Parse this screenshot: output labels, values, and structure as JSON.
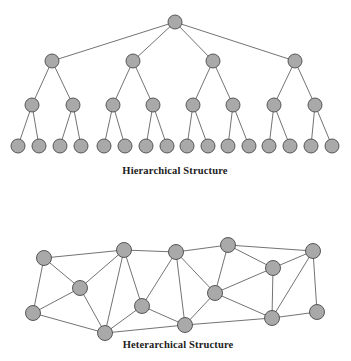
{
  "figure": {
    "width": 351,
    "height": 361,
    "background_color": "#ffffff",
    "node_fill_color": "#a9a9a9",
    "node_stroke_color": "#4a4a4a",
    "edge_color": "#5a5a5a",
    "caption_color": "#1c1c1c"
  },
  "diagrams": [
    {
      "id": "hierarchical",
      "caption": "Hierarchical Structure",
      "caption_position": {
        "x": 175,
        "y": 174
      },
      "node_radius": 7,
      "levels": [
        {
          "level": 1,
          "count": 1
        },
        {
          "level": 2,
          "count": 4
        },
        {
          "level": 3,
          "count": 8
        },
        {
          "level": 4,
          "count": 16
        }
      ],
      "nodes": [
        {
          "id": "h0",
          "x": 175,
          "y": 22,
          "level": 1
        },
        {
          "id": "h1",
          "x": 52,
          "y": 61,
          "level": 2
        },
        {
          "id": "h2",
          "x": 133,
          "y": 61,
          "level": 2
        },
        {
          "id": "h3",
          "x": 213,
          "y": 61,
          "level": 2
        },
        {
          "id": "h4",
          "x": 295,
          "y": 61,
          "level": 2
        },
        {
          "id": "h5",
          "x": 32,
          "y": 105,
          "level": 3
        },
        {
          "id": "h6",
          "x": 73,
          "y": 105,
          "level": 3
        },
        {
          "id": "h7",
          "x": 113,
          "y": 105,
          "level": 3
        },
        {
          "id": "h8",
          "x": 153,
          "y": 105,
          "level": 3
        },
        {
          "id": "h9",
          "x": 193,
          "y": 105,
          "level": 3
        },
        {
          "id": "h10",
          "x": 233,
          "y": 105,
          "level": 3
        },
        {
          "id": "h11",
          "x": 274,
          "y": 105,
          "level": 3
        },
        {
          "id": "h12",
          "x": 315,
          "y": 105,
          "level": 3
        },
        {
          "id": "h13",
          "x": 18,
          "y": 146,
          "level": 4
        },
        {
          "id": "h14",
          "x": 39,
          "y": 146,
          "level": 4
        },
        {
          "id": "h15",
          "x": 60,
          "y": 146,
          "level": 4
        },
        {
          "id": "h16",
          "x": 81,
          "y": 146,
          "level": 4
        },
        {
          "id": "h17",
          "x": 104,
          "y": 146,
          "level": 4
        },
        {
          "id": "h18",
          "x": 125,
          "y": 146,
          "level": 4
        },
        {
          "id": "h19",
          "x": 146,
          "y": 146,
          "level": 4
        },
        {
          "id": "h20",
          "x": 167,
          "y": 146,
          "level": 4
        },
        {
          "id": "h21",
          "x": 187,
          "y": 146,
          "level": 4
        },
        {
          "id": "h22",
          "x": 208,
          "y": 146,
          "level": 4
        },
        {
          "id": "h23",
          "x": 228,
          "y": 146,
          "level": 4
        },
        {
          "id": "h24",
          "x": 249,
          "y": 146,
          "level": 4
        },
        {
          "id": "h25",
          "x": 269,
          "y": 146,
          "level": 4
        },
        {
          "id": "h26",
          "x": 290,
          "y": 146,
          "level": 4
        },
        {
          "id": "h27",
          "x": 311,
          "y": 146,
          "level": 4
        },
        {
          "id": "h28",
          "x": 332,
          "y": 146,
          "level": 4
        }
      ],
      "edges": [
        [
          "h0",
          "h1"
        ],
        [
          "h0",
          "h2"
        ],
        [
          "h0",
          "h3"
        ],
        [
          "h0",
          "h4"
        ],
        [
          "h1",
          "h5"
        ],
        [
          "h1",
          "h6"
        ],
        [
          "h2",
          "h7"
        ],
        [
          "h2",
          "h8"
        ],
        [
          "h3",
          "h9"
        ],
        [
          "h3",
          "h10"
        ],
        [
          "h4",
          "h11"
        ],
        [
          "h4",
          "h12"
        ],
        [
          "h5",
          "h13"
        ],
        [
          "h5",
          "h14"
        ],
        [
          "h6",
          "h15"
        ],
        [
          "h6",
          "h16"
        ],
        [
          "h7",
          "h17"
        ],
        [
          "h7",
          "h18"
        ],
        [
          "h8",
          "h19"
        ],
        [
          "h8",
          "h20"
        ],
        [
          "h9",
          "h21"
        ],
        [
          "h9",
          "h22"
        ],
        [
          "h10",
          "h23"
        ],
        [
          "h10",
          "h24"
        ],
        [
          "h11",
          "h25"
        ],
        [
          "h11",
          "h26"
        ],
        [
          "h12",
          "h27"
        ],
        [
          "h12",
          "h28"
        ]
      ]
    },
    {
      "id": "heterarchical",
      "caption": "Heterarchical Structure",
      "caption_position": {
        "x": 178,
        "y": 348
      },
      "node_radius": 7.5,
      "nodes": [
        {
          "id": "n0",
          "x": 44,
          "y": 258
        },
        {
          "id": "n1",
          "x": 80,
          "y": 288
        },
        {
          "id": "n2",
          "x": 33,
          "y": 313
        },
        {
          "id": "n3",
          "x": 105,
          "y": 333
        },
        {
          "id": "n4",
          "x": 124,
          "y": 250
        },
        {
          "id": "n5",
          "x": 142,
          "y": 306
        },
        {
          "id": "n6",
          "x": 176,
          "y": 252
        },
        {
          "id": "n7",
          "x": 185,
          "y": 325
        },
        {
          "id": "n8",
          "x": 215,
          "y": 293
        },
        {
          "id": "n9",
          "x": 228,
          "y": 245
        },
        {
          "id": "n10",
          "x": 273,
          "y": 268
        },
        {
          "id": "n11",
          "x": 313,
          "y": 251
        },
        {
          "id": "n12",
          "x": 272,
          "y": 318
        },
        {
          "id": "n13",
          "x": 317,
          "y": 312
        }
      ],
      "edges": [
        [
          "n0",
          "n2"
        ],
        [
          "n0",
          "n1"
        ],
        [
          "n0",
          "n4"
        ],
        [
          "n1",
          "n2"
        ],
        [
          "n1",
          "n3"
        ],
        [
          "n1",
          "n4"
        ],
        [
          "n2",
          "n3"
        ],
        [
          "n3",
          "n4"
        ],
        [
          "n3",
          "n5"
        ],
        [
          "n3",
          "n7"
        ],
        [
          "n4",
          "n5"
        ],
        [
          "n4",
          "n6"
        ],
        [
          "n5",
          "n6"
        ],
        [
          "n5",
          "n7"
        ],
        [
          "n6",
          "n7"
        ],
        [
          "n6",
          "n8"
        ],
        [
          "n6",
          "n9"
        ],
        [
          "n7",
          "n8"
        ],
        [
          "n7",
          "n12"
        ],
        [
          "n8",
          "n9"
        ],
        [
          "n8",
          "n10"
        ],
        [
          "n8",
          "n12"
        ],
        [
          "n9",
          "n10"
        ],
        [
          "n9",
          "n11"
        ],
        [
          "n10",
          "n11"
        ],
        [
          "n10",
          "n12"
        ],
        [
          "n11",
          "n12"
        ],
        [
          "n11",
          "n13"
        ],
        [
          "n12",
          "n13"
        ]
      ]
    }
  ]
}
